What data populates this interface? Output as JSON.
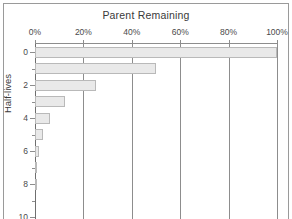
{
  "chart_data": {
    "type": "bar",
    "orientation": "horizontal",
    "title": "Parent Remaining",
    "xlabel": "",
    "ylabel": "Half-lives",
    "categories": [
      0,
      1,
      2,
      3,
      4,
      5,
      6,
      7,
      8,
      9,
      10
    ],
    "values": [
      100,
      50,
      25,
      12.5,
      6.25,
      3.125,
      1.5625,
      0.78125,
      0.390625,
      0.1953125,
      0.09765625
    ],
    "x_tick_labels": [
      "0%",
      "20%",
      "40%",
      "60%",
      "80%",
      "100%"
    ],
    "x_tick_values": [
      0,
      20,
      40,
      60,
      80,
      100
    ],
    "y_tick_labels": [
      "0",
      "2",
      "4",
      "6",
      "8",
      "10"
    ],
    "y_tick_values": [
      0,
      2,
      4,
      6,
      8,
      10
    ],
    "y_minor_tick_values": [
      1,
      3,
      5,
      7,
      9
    ],
    "xlim": [
      0,
      100
    ],
    "ylim": [
      -0.6,
      10.6
    ],
    "grid": "vertical",
    "legend": "none",
    "bar_fill_color": "#e9e9e9",
    "bar_border_color": "#b9b9b9",
    "gridline_color": "#8d8d8d",
    "axis_color": "#6f6f6f",
    "text_color": "#3a3a3a",
    "background_color": "#ffffff",
    "frame_border_color": "#9a9a9a",
    "note": "Exponential decay: parent remaining halves each half-life"
  }
}
